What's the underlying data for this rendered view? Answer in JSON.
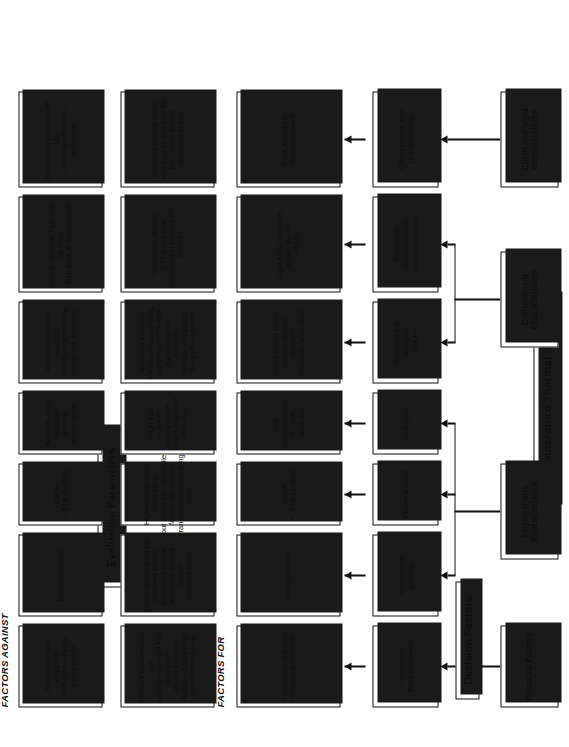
{
  "diagram": {
    "title": "Low Temperature Thermal Stripping",
    "columns": {
      "decision_factors": "Decision Factors",
      "evaluation_parameters": "Evaluation Parameters",
      "factors_for": "FACTORS FOR",
      "factors_against": "FACTORS AGAINST"
    },
    "categories": [
      {
        "id": "financial",
        "label": "Financial Factors"
      },
      {
        "id": "physical",
        "label": "Physical Site\nCharacteristics"
      },
      {
        "id": "contaminant",
        "label": "Contaminant\nCharacteristics"
      },
      {
        "id": "client",
        "label": "Client and legal\nconsiderations"
      }
    ],
    "rows": [
      {
        "category": "financial",
        "node": "Operation\nRequirements",
        "factors_for": "Excavation required;\nPresence of VOCs",
        "evaluation": "Efficient treatment for low\nmolecular weight HCs and VOCs\nAvoids potential liability of landfilling\ncontaminated soils",
        "factors_against": "Excavation not required;\nhalogenated HCs mixed waste"
      },
      {
        "category": "physical",
        "node": "Subsurface\ngeology",
        "factors_for": "Homogeneous",
        "evaluation": "Large debris must be removed before\ntreatment; Rocks, boulders, paving rubble\nincrease costs",
        "factors_against": "Heterogeneous"
      },
      {
        "category": "physical",
        "node": "Plume Extent",
        "factors_for": "Small\n< .5 ha (1 acre)",
        "evaluation": "Higher costs favor small sites\nbut an on-site or mobile facility can reduce\ntransportation/operating costs",
        "factors_against": "Large\n> .5 ha (1 acre)"
      },
      {
        "category": "physical",
        "node": "Soil type",
        "factors_for": "Dry, homogeneous;\nUniform particles",
        "evaluation": "High soil moisture, precipitation,\nrunoff degrades efficiency",
        "factors_against": "Wet soil, high moisture\ncontent,\nheavy runoff"
      },
      {
        "category": "contaminant",
        "node": "Sampling &\nanalysis\n(TCLP)",
        "factors_for": "Some mixed waste,\nvolatile organic solvents;\nKetones, aromatics",
        "evaluation": "An option available for mixed waste sites;\npetroleum HCs and lighter organic solvents;\nmetals, inorganics must be excluded",
        "factors_against": "Nonvolatile mixed wastes,\nmetals, radionuclides\nheavy oils, greases"
      },
      {
        "category": "contaminant",
        "node": "Chemical\ncharacteristics\nof contaminants",
        "factors_for": "Light HCs, gasoline,\navgas, jet fuel,\nVOCs",
        "evaluation": "Gasolines, diesels\nLTTS requires volatilization below 275°C\n(500°F)",
        "factors_against": "Heavy, viscous, high mol.\nwt. HCs\nfuel, lube, & heating oils"
      },
      {
        "category": "client",
        "node": "Client needs and\nrequirements",
        "factors_for": "Fast, closure is\nstraightforward",
        "evaluation": "Soils are usually clean and may be used for fill;\nLong-term liability exposure is low",
        "factors_against": "Expensive, possible off-site\ncontamination from emissions"
      }
    ]
  }
}
